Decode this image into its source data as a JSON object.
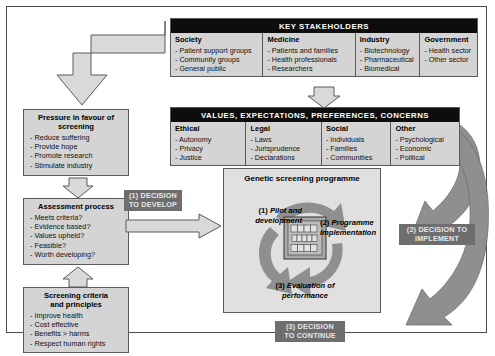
{
  "diagram": {
    "colors": {
      "panel_fill": "#d4d4d4",
      "header_bar": "#0d0d0d",
      "arrow_fill": "#8f8f8f",
      "outline_arrow_fill": "#d9d9d9",
      "chip_fill": "#6e6e6e",
      "border": "#5a5a5a",
      "programme_fill": "#e0e0e0"
    }
  },
  "stakeholders": {
    "bar_label": "KEY STAKEHOLDERS",
    "columns": [
      {
        "title": "Society",
        "items": [
          "Patient support groups",
          "Community groups",
          "General public"
        ]
      },
      {
        "title": "Medicine",
        "items": [
          "Patients and families",
          "Health professionals",
          "Researchers"
        ]
      },
      {
        "title": "Industry",
        "items": [
          "Biotechnology",
          "Pharmaceutical",
          "Biomedical"
        ]
      },
      {
        "title": "Government",
        "items": [
          "Health sector",
          "Other sector"
        ]
      }
    ]
  },
  "values": {
    "bar_label": "VALUES, EXPECTATIONS, PREFERENCES, CONCERNS",
    "columns": [
      {
        "title": "Ethical",
        "items": [
          "Autonomy",
          "Privacy",
          "Justice"
        ]
      },
      {
        "title": "Legal",
        "items": [
          "Laws",
          "Jurisprudence",
          "Declarations"
        ]
      },
      {
        "title": "Social",
        "items": [
          "Individuals",
          "Families",
          "Communities"
        ]
      },
      {
        "title": "Other",
        "items": [
          "Psychological",
          "Economic",
          "Political"
        ]
      }
    ]
  },
  "left_boxes": [
    {
      "title_line1": "Pressure in favour of",
      "title_line2": "screening",
      "items": [
        "Reduce suffering",
        "Provide hope",
        "Promote research",
        "Stimulate industry"
      ]
    },
    {
      "title_line1": "Assessment process",
      "title_line2": "",
      "items": [
        "Meets criteria?",
        "Evidence based?",
        "Values upheld?",
        "Feasible?",
        "Worth developing?"
      ]
    },
    {
      "title_line1": "Screening criteria",
      "title_line2": "and principles",
      "items": [
        "Improve health",
        "Cost effective",
        "Benefits > harms",
        "Respect human rights"
      ]
    }
  ],
  "programme": {
    "title": "Genetic screening programme",
    "stages": [
      {
        "num": "(1)",
        "label_line1": "Pilot and",
        "label_line2": "development"
      },
      {
        "num": "(2)",
        "label_line1": "Programme",
        "label_line2": "implementation"
      },
      {
        "num": "(3)",
        "label_line1": "Evaluation of",
        "label_line2": "performance"
      }
    ],
    "icon_name": "gel-array-icon"
  },
  "decisions": [
    {
      "line1": "(1) DECISION",
      "line2": "TO DEVELOP"
    },
    {
      "line1": "(2) DECISION TO",
      "line2": "IMPLEMENT"
    },
    {
      "line1": "(3) DECISION",
      "line2": "TO CONTINUE"
    }
  ]
}
